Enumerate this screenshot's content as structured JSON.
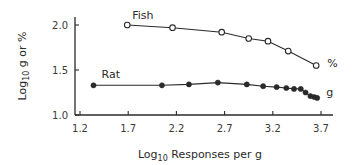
{
  "chart_data": {
    "type": "line",
    "title": "",
    "xlabel": "Log10 Responses per g",
    "ylabel": "Log10 g or %",
    "xlabel_parts": {
      "prefix": "Log",
      "sub": "10",
      "suffix": " Responses per g"
    },
    "ylabel_parts": {
      "prefix": "Log",
      "sub": "10",
      "suffix": " g or %"
    },
    "xlim": [
      1.2,
      3.7
    ],
    "ylim": [
      1.0,
      2.0
    ],
    "x_ticks": [
      1.2,
      1.7,
      2.2,
      2.7,
      3.2,
      3.7
    ],
    "x_tick_labels": [
      "1.2",
      "1.7",
      "2.2",
      "2.7",
      "3.2",
      "3.7"
    ],
    "y_ticks": [
      1.0,
      1.5,
      2.0
    ],
    "y_tick_labels": [
      "1.0",
      "1.5",
      "2.0"
    ],
    "grid": false,
    "legend": "inline labels",
    "series": [
      {
        "name": "Fish",
        "marker": "open-circle",
        "end_label": "%",
        "x": [
          1.69,
          2.16,
          2.67,
          2.95,
          3.15,
          3.36,
          3.65
        ],
        "y": [
          2.0,
          1.97,
          1.92,
          1.85,
          1.82,
          1.71,
          1.55
        ]
      },
      {
        "name": "Rat",
        "marker": "filled-circle",
        "end_label": "g",
        "x": [
          1.34,
          2.05,
          2.33,
          2.63,
          2.93,
          3.1,
          3.24,
          3.34,
          3.42,
          3.49,
          3.54,
          3.59,
          3.63,
          3.66
        ],
        "y": [
          1.33,
          1.33,
          1.34,
          1.36,
          1.34,
          1.32,
          1.31,
          1.3,
          1.29,
          1.29,
          1.25,
          1.21,
          1.2,
          1.19
        ]
      }
    ]
  },
  "colors": {
    "ink": "#2a2a2a",
    "background": "#ffffff"
  }
}
